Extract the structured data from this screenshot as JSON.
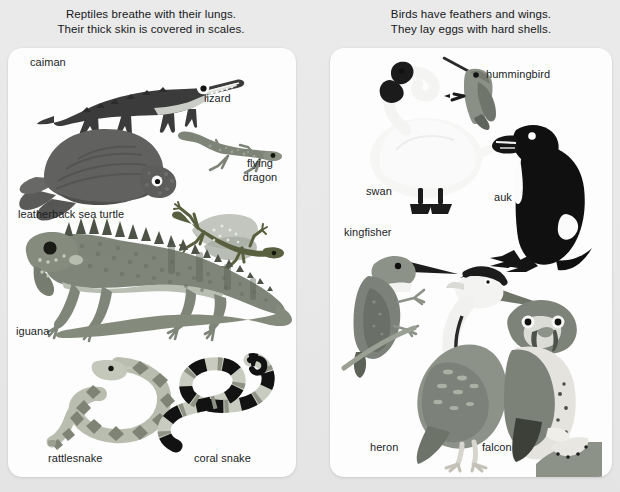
{
  "page": {
    "background_color": "#e8e8e8",
    "card_color": "#fdfdfd",
    "text_color": "#1b1d1f"
  },
  "left_panel": {
    "headline_line1": "Reptiles breathe with their lungs.",
    "headline_line2": "Their thick skin is covered in scales.",
    "labels": [
      {
        "key": "caiman",
        "text": "caiman"
      },
      {
        "key": "lizard",
        "text": "lizard"
      },
      {
        "key": "leatherback",
        "text": "leatherback sea turtle"
      },
      {
        "key": "flying_dragon_l1",
        "text": "flying"
      },
      {
        "key": "flying_dragon_l2",
        "text": "dragon"
      },
      {
        "key": "iguana",
        "text": "iguana"
      },
      {
        "key": "rattlesnake",
        "text": "rattlesnake"
      },
      {
        "key": "coral_snake",
        "text": "coral snake"
      }
    ]
  },
  "right_panel": {
    "headline_line1": "Birds have feathers and wings.",
    "headline_line2": "They lay eggs with hard shells.",
    "labels": [
      {
        "key": "hummingbird",
        "text": "hummingbird"
      },
      {
        "key": "swan",
        "text": "swan"
      },
      {
        "key": "auk",
        "text": "auk"
      },
      {
        "key": "kingfisher",
        "text": "kingfisher"
      },
      {
        "key": "heron",
        "text": "heron"
      },
      {
        "key": "falcon",
        "text": "falcon"
      }
    ]
  },
  "illustrations": {
    "reptiles": [
      "caiman",
      "lizard",
      "leatherback-sea-turtle",
      "flying-dragon",
      "iguana",
      "rattlesnake",
      "coral-snake"
    ],
    "birds": [
      "swan",
      "hummingbird",
      "auk",
      "kingfisher",
      "heron",
      "falcon"
    ]
  }
}
